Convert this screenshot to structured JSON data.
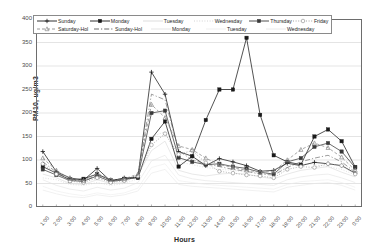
{
  "chart_data": {
    "type": "line",
    "title": "",
    "xlabel": "Hours",
    "ylabel": "PM10, ug/m3",
    "ylim": [
      0,
      400
    ],
    "yticks": [
      0,
      50,
      100,
      150,
      200,
      250,
      300,
      350,
      400
    ],
    "grid": true,
    "legend_position": "top-inside",
    "categories": [
      "1:00",
      "2:00",
      "3:00",
      "4:00",
      "5:00",
      "6:00",
      "7:00",
      "8:00",
      "9:00",
      "10:00",
      "11:00",
      "12:00",
      "13:00",
      "14:00",
      "15:00",
      "16:00",
      "17:00",
      "18:00",
      "19:00",
      "20:00",
      "21:00",
      "22:00",
      "23:00",
      "0:00"
    ],
    "series": [
      {
        "name": "Sunday",
        "color": "#1a1a1a",
        "marker": "plus",
        "dash": "none",
        "values": [
          118,
          75,
          62,
          57,
          82,
          55,
          62,
          63,
          287,
          240,
          118,
          108,
          88,
          103,
          96,
          88,
          76,
          78,
          93,
          88,
          95,
          92,
          88,
          72
        ]
      },
      {
        "name": "Monday",
        "color": "#1a1a1a",
        "marker": "square",
        "dash": "none",
        "values": [
          86,
          72,
          58,
          60,
          70,
          57,
          60,
          62,
          145,
          182,
          86,
          108,
          185,
          250,
          250,
          360,
          196,
          110,
          96,
          90,
          150,
          165,
          140,
          85
        ]
      },
      {
        "name": "Tuesday",
        "color": "#d9d9d9",
        "marker": "none",
        "dash": "none",
        "values": [
          70,
          62,
          50,
          48,
          58,
          50,
          52,
          68,
          120,
          140,
          78,
          70,
          66,
          70,
          72,
          70,
          64,
          60,
          70,
          78,
          82,
          86,
          74,
          64
        ]
      },
      {
        "name": "Wednesday",
        "color": "#cfcfcf",
        "marker": "none",
        "dash": "dot",
        "values": [
          62,
          58,
          48,
          46,
          52,
          46,
          50,
          60,
          150,
          160,
          96,
          90,
          84,
          80,
          78,
          74,
          72,
          70,
          88,
          95,
          90,
          86,
          80,
          68
        ]
      },
      {
        "name": "Thursday",
        "color": "#3a3a3a",
        "marker": "square",
        "dash": "none",
        "values": [
          80,
          68,
          56,
          55,
          66,
          54,
          58,
          64,
          200,
          205,
          105,
          96,
          90,
          92,
          86,
          82,
          74,
          70,
          96,
          104,
          128,
          136,
          118,
          84
        ]
      },
      {
        "name": "Friday",
        "color": "#9a9a9a",
        "marker": "circle",
        "dash": "dot",
        "values": [
          92,
          70,
          55,
          52,
          62,
          52,
          56,
          66,
          132,
          156,
          112,
          120,
          94,
          76,
          72,
          68,
          66,
          62,
          80,
          86,
          84,
          92,
          88,
          70
        ]
      },
      {
        "name": "Saturday-Hol",
        "color": "#8c8c8c",
        "marker": "triangle",
        "dash": "dash",
        "values": [
          104,
          78,
          60,
          56,
          72,
          58,
          60,
          70,
          218,
          190,
          130,
          122,
          104,
          90,
          84,
          78,
          74,
          76,
          100,
          122,
          136,
          126,
          106,
          78
        ]
      },
      {
        "name": "Sunday-Hol",
        "color": "#5a5a5a",
        "marker": "none",
        "dash": "dashdot",
        "values": [
          96,
          74,
          58,
          54,
          68,
          56,
          58,
          68,
          240,
          228,
          120,
          100,
          92,
          86,
          80,
          76,
          70,
          68,
          84,
          96,
          104,
          110,
          96,
          74
        ]
      },
      {
        "name": "Monday",
        "color": "#e2e2e2",
        "marker": "none",
        "dash": "none",
        "values": [
          58,
          46,
          38,
          34,
          42,
          36,
          40,
          52,
          98,
          110,
          68,
          60,
          56,
          54,
          52,
          50,
          48,
          46,
          58,
          64,
          68,
          70,
          62,
          52
        ]
      },
      {
        "name": "Tuesday",
        "color": "#ededed",
        "marker": "none",
        "dash": "none",
        "values": [
          44,
          34,
          28,
          24,
          30,
          26,
          30,
          40,
          84,
          92,
          56,
          52,
          48,
          46,
          44,
          42,
          40,
          38,
          48,
          54,
          56,
          58,
          52,
          42
        ]
      },
      {
        "name": "Wednesday",
        "color": "#e8e8e8",
        "marker": "none",
        "dash": "none",
        "values": [
          36,
          28,
          22,
          20,
          26,
          22,
          26,
          34,
          72,
          80,
          48,
          44,
          42,
          40,
          38,
          36,
          34,
          32,
          42,
          46,
          50,
          52,
          46,
          36
        ]
      }
    ]
  },
  "axis": {
    "ylabel": "PM10, ug/m3",
    "xlabel": "Hours",
    "yticks": [
      "400",
      "350",
      "300",
      "250",
      "200",
      "150",
      "100",
      "50",
      "0"
    ],
    "xticks": [
      "1:00",
      "2:00",
      "3:00",
      "4:00",
      "5:00",
      "6:00",
      "7:00",
      "8:00",
      "9:00",
      "10:00",
      "11:00",
      "12:00",
      "13:00",
      "14:00",
      "15:00",
      "16:00",
      "17:00",
      "18:00",
      "19:00",
      "20:00",
      "21:00",
      "22:00",
      "23:00",
      "0:00"
    ]
  },
  "legend": {
    "row1": [
      {
        "label": "Sunday",
        "key": "line-plus-solid-dark"
      },
      {
        "label": "Monday",
        "key": "line-square-solid-dark"
      },
      {
        "label": "Tuesday",
        "key": "line-plain-solid-light"
      },
      {
        "label": "Wednesday",
        "key": "line-plain-dot-light"
      },
      {
        "label": "Thursday",
        "key": "line-square-solid-gray"
      },
      {
        "label": "Friday",
        "key": "line-circle-dot-gray"
      }
    ],
    "row2": [
      {
        "label": "Saturday-Hol",
        "key": "line-triangle-dash-gray"
      },
      {
        "label": "Sunday-Hol",
        "key": "line-plain-dashdot-gray"
      },
      {
        "label": "Monday",
        "key": "line-plain-solid-pale"
      },
      {
        "label": "Tuesday",
        "key": "line-plain-solid-pale2"
      },
      {
        "label": "Wednesday",
        "key": "line-plain-solid-pale3"
      }
    ]
  }
}
